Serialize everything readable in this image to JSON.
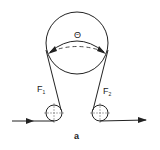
{
  "diagram": {
    "caption": "a",
    "angle_label": "Θ",
    "force_left": {
      "symbol": "F",
      "subscript": "1"
    },
    "force_right": {
      "symbol": "F",
      "subscript": "2"
    },
    "colors": {
      "stroke": "#222222",
      "background": "#ffffff"
    }
  }
}
